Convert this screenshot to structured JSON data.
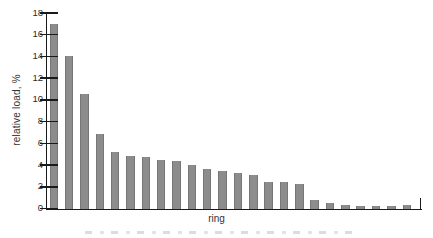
{
  "figure": {
    "background": "#ffffff"
  },
  "chart_data": {
    "type": "bar",
    "title": "",
    "xlabel": "ring",
    "ylabel": "relative load, %",
    "ylim": [
      0,
      18
    ],
    "ytick_step": 2,
    "yticks": [
      0,
      2,
      4,
      6,
      8,
      10,
      12,
      14,
      16,
      18
    ],
    "x_tick_labels_shown": false,
    "grid": false,
    "legend": false,
    "categories": [
      1,
      2,
      3,
      4,
      5,
      6,
      7,
      8,
      9,
      10,
      11,
      12,
      13,
      14,
      15,
      16,
      17,
      18,
      19,
      20,
      21,
      22,
      23,
      24
    ],
    "values": [
      17.0,
      14.0,
      10.5,
      6.9,
      5.2,
      4.8,
      4.7,
      4.5,
      4.4,
      4.0,
      3.6,
      3.5,
      3.3,
      3.1,
      2.4,
      2.4,
      2.3,
      0.8,
      0.55,
      0.35,
      0.25,
      0.25,
      0.25,
      0.3
    ],
    "bar_color": "#8c8c8c",
    "bar_edge_color": "#767676",
    "axis_color": "#1a1a1a",
    "tick_label_color": "#2b2b2b",
    "label_color": "#333333"
  }
}
